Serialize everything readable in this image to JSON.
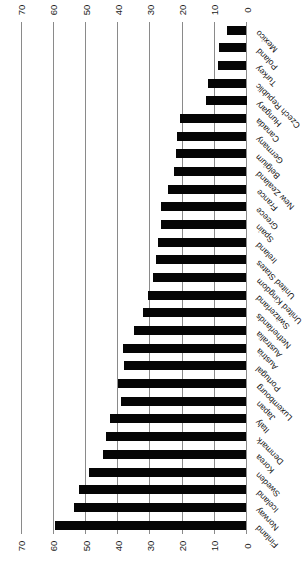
{
  "chart_data": {
    "type": "bar",
    "presentation": "column chart rotated 90 degrees counterclockwise; bars run horizontally from a zero baseline on the right toward the left; value axis tick labels appear along both the top and bottom edges reading 70 to 0 from left to right; category labels are diagonal along the right edge",
    "title": "",
    "xlabel": "",
    "ylabel": "",
    "categories": [
      "Mexico",
      "Poland",
      "Turkey",
      "Czech Republic",
      "Hungary",
      "Canada",
      "Germany",
      "Belgium",
      "New Zealand",
      "France",
      "Greece",
      "Spain",
      "Ireland",
      "United States",
      "United Kingdom",
      "Switzerland",
      "Netherlands",
      "Australia",
      "Austria",
      "Portugal",
      "Luxembourg",
      "Japan",
      "Italy",
      "Denmark",
      "Korea",
      "Sweden",
      "Iceland",
      "Norway",
      "Finland"
    ],
    "values": [
      6,
      8.5,
      9,
      12,
      12.5,
      20.5,
      21.5,
      22,
      22.5,
      24.5,
      26.5,
      26.5,
      27.5,
      28,
      29,
      30.5,
      32,
      35,
      38.5,
      38,
      40,
      39,
      42.5,
      43.5,
      44.5,
      49,
      52,
      53.5,
      59.5
    ],
    "value_axis_ticks": [
      70,
      60,
      50,
      40,
      30,
      20,
      10,
      0
    ],
    "value_axis_range": [
      0,
      70
    ],
    "tick_label_rows": [
      "top",
      "bottom"
    ],
    "grid": true,
    "legend": null,
    "colors": {
      "bar": "#050505",
      "gridline": "#8a8a8a",
      "text": "#1c1c1c",
      "background": "#ffffff"
    }
  }
}
